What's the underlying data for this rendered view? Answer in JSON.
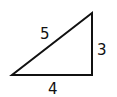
{
  "diagram": {
    "type": "right-triangle",
    "stroke_color": "#111111",
    "background": "#ffffff",
    "vertices": {
      "bottom_left": [
        12,
        75
      ],
      "bottom_right": [
        92,
        75
      ],
      "top_right": [
        92,
        13
      ]
    },
    "labels": {
      "hypotenuse": "5",
      "vertical_leg": "3",
      "horizontal_leg": "4"
    }
  }
}
